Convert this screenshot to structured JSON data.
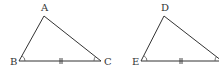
{
  "figure": {
    "stroke_color": "#333333",
    "background": "#ffffff"
  },
  "triangles": [
    {
      "name": "ABC",
      "vertices": [
        {
          "label": "A",
          "x": 44,
          "y": 16,
          "label_x": 41,
          "label_y": 11
        },
        {
          "label": "B",
          "x": 19,
          "y": 61,
          "label_x": 10,
          "label_y": 65
        },
        {
          "label": "C",
          "x": 101,
          "y": 61,
          "label_x": 104,
          "label_y": 65
        }
      ],
      "equal_side_mark": {
        "side": "BC",
        "ticks": 2,
        "x": 61,
        "y": 61
      },
      "angle_marks": [
        "B",
        "C"
      ]
    },
    {
      "name": "DEF",
      "vertices": [
        {
          "label": "D",
          "x": 164,
          "y": 16,
          "label_x": 161,
          "label_y": 11
        },
        {
          "label": "E",
          "x": 141,
          "y": 61,
          "label_x": 132,
          "label_y": 65
        },
        {
          "label": "",
          "x": 222,
          "y": 61,
          "label_x": 224,
          "label_y": 65
        }
      ],
      "equal_side_mark": {
        "side": "EF",
        "ticks": 2,
        "x": 181,
        "y": 61
      },
      "angle_marks": [
        "E",
        "F"
      ]
    }
  ],
  "labels": {
    "A": "A",
    "B": "B",
    "C": "C",
    "D": "D",
    "E": "E"
  }
}
